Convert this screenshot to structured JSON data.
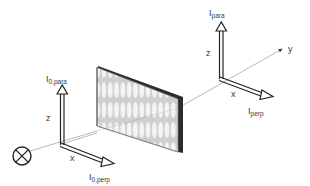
{
  "diagram": {
    "type": "optics-polarization-setup",
    "colors": {
      "line": "#8a8a8a",
      "arrow": "#222222",
      "plate_edge": "#2b2b2b",
      "plate_face": "#e4e4e4",
      "text": "#3a3a3a"
    },
    "source": {
      "symbol": "circle-x-icon"
    },
    "incident_frame": {
      "z_label": "z",
      "x_label": "x",
      "para_label_main": "I",
      "para_label_sub": "0,para",
      "perp_label_main": "I",
      "perp_label_sub": "0,perp"
    },
    "sample": {
      "name": "patterned plate",
      "rows": 3,
      "columns": 13
    },
    "transmitted_frame": {
      "z_label": "z",
      "x_label": "x",
      "y_label": "y",
      "para_label_main": "I",
      "para_label_sub": "para",
      "perp_label_main": "I",
      "perp_label_sub": "perp"
    }
  }
}
